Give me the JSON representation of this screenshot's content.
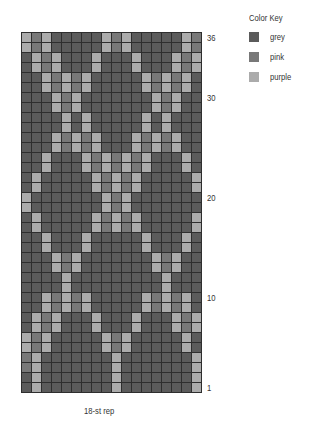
{
  "chart_data": {
    "type": "heatmap",
    "title": "",
    "columns": 18,
    "rows": 36,
    "xlabel": "18-st rep",
    "row_labels": [
      {
        "row": 36,
        "label": "36"
      },
      {
        "row": 30,
        "label": "30"
      },
      {
        "row": 20,
        "label": "20"
      },
      {
        "row": 10,
        "label": "10"
      },
      {
        "row": 1,
        "label": "1"
      }
    ],
    "legend": {
      "title": "Color Key",
      "entries": [
        {
          "key": "G",
          "label": "grey",
          "color": "#5b5b5b"
        },
        {
          "key": "P",
          "label": "pink",
          "color": "#787878"
        },
        {
          "key": "U",
          "label": "purple",
          "color": "#ababab"
        }
      ]
    },
    "grid_top_to_bottom": [
      "UPUGGGGGUPUGGGGGUP",
      "UPUGGGGGUPUGGGGGUP",
      "GUPUGGGUGGGUGGGUPU",
      "GUPUGGGUGGGUGGGUPU",
      "GGUPUPUGGGGGUPUPUG",
      "GGUPUPUGGGGGUPUPUG",
      "GGGUPUGGGGGGGUPUGG",
      "GGGUPUGGGGGGGUPUGG",
      "GGGGUGUGGGGGUGUGGG",
      "GGGGUGUGGGGGUGUGGG",
      "GGGUPUPUGGGUPUPUGG",
      "GGGUPUPUGGGUPUPUGG",
      "GGUGGGUPUPUPUGGGUG",
      "GGUGGGUPUPUPUGGGUG",
      "GUGGGGGUPUPUGGGGGU",
      "GUGGGGGUPUPUGGGGGU",
      "UGGGGGGGUPUGGGGGGG",
      "UGGGGGGGUPUGGGGGGG",
      "GUGGGGGUPUPUGGGGGU",
      "GUGGGGGUPUPUGGGGGU",
      "GGUGGGUGGGGGUGGGUG",
      "GGUGGGUGGGGGUGGGUG",
      "GGGUPUGGGGGGGUPUGG",
      "GGGUPUGGGGGGGUPUGG",
      "GGGGUGGGGGGGGGUGGG",
      "GGGGUGGGGGGGGGUGGG",
      "GGUPUPUGGGGGUPUPUG",
      "GGUPUPUGGGGGUPUPUG",
      "GUPUGGGUGGGUGGGUPU",
      "GUPUGGGUGGGUGGGUPU",
      "UPUGGGGGUPUGGGGGUG",
      "UPUGGGGGUPUGGGGGUG",
      "PUGGGGGGGUGGGGGGGU",
      "PUGGGGGGGUGGGGGGGU",
      "GUGGGGGGGUGGGGGGGU",
      "GUGGGGGGGUGGGGGGGU"
    ],
    "grid_on": true,
    "legend_position": "top-right"
  },
  "labels": {
    "legend_title": "Color Key",
    "legend": [
      "grey",
      "pink",
      "purple"
    ],
    "rows": [
      "36",
      "30",
      "20",
      "10",
      "1"
    ],
    "rep": "18-st rep"
  }
}
